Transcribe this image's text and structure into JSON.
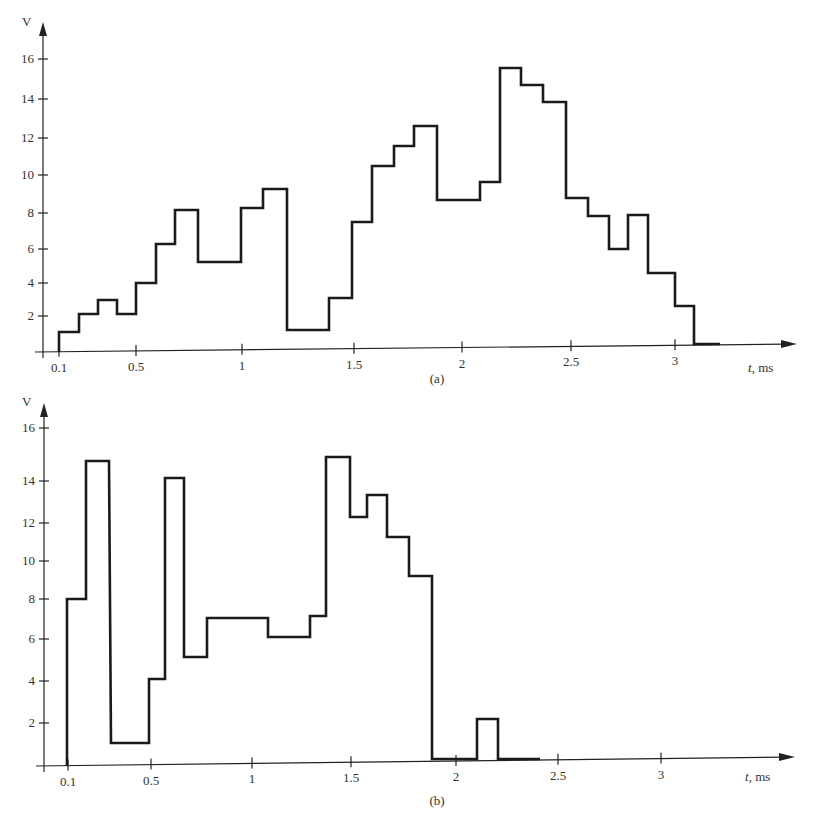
{
  "chart_data": [
    {
      "id": "a",
      "type": "line",
      "subtype": "step",
      "caption": "(a)",
      "ylabel": "V",
      "xlabel_italic": "t",
      "xlabel_rest": ", ms",
      "yticks": [
        2,
        4,
        6,
        8,
        10,
        12,
        14,
        16
      ],
      "xticks": [
        "0.1",
        "0.5",
        "1",
        "1.5",
        "2",
        "2.5",
        "3"
      ],
      "ylim": [
        0,
        17
      ],
      "xlim": [
        0,
        3.5
      ],
      "grid": false,
      "steps": {
        "t_edges": [
          0.1,
          0.2,
          0.3,
          0.4,
          0.5,
          0.6,
          0.7,
          0.8,
          1.0,
          1.1,
          1.2,
          1.4,
          1.5,
          1.6,
          1.7,
          1.8,
          1.9,
          2.1,
          2.2,
          2.3,
          2.4,
          2.5,
          2.6,
          2.7,
          2.8,
          2.9,
          3.0,
          3.1,
          3.2
        ],
        "values": [
          1.1,
          2.1,
          3.0,
          2.1,
          4.0,
          6.2,
          8.1,
          5.2,
          8.2,
          9.2,
          1.2,
          3.1,
          7.4,
          10.4,
          11.5,
          12.5,
          8.6,
          9.6,
          15.5,
          14.6,
          13.8,
          8.7,
          7.7,
          5.8,
          7.8,
          4.6,
          2.6,
          0.2
        ]
      }
    },
    {
      "id": "b",
      "type": "line",
      "subtype": "step",
      "caption": "(b)",
      "ylabel": "V",
      "xlabel_italic": "t",
      "xlabel_rest": ", ms",
      "yticks": [
        2,
        4,
        6,
        8,
        10,
        12,
        14,
        16
      ],
      "xticks": [
        "0.1",
        "0.5",
        "1",
        "1.5",
        "2",
        "2.5",
        "3"
      ],
      "ylim": [
        0,
        17
      ],
      "xlim": [
        0,
        3.5
      ],
      "grid": false,
      "steps": {
        "t_edges": [
          0.1,
          0.2,
          0.3,
          0.5,
          0.55,
          0.65,
          0.75,
          1.05,
          1.25,
          1.35,
          1.47,
          1.55,
          1.65,
          1.75,
          1.87,
          2.1,
          2.2,
          2.42
        ],
        "values": [
          8.0,
          14.9,
          1.0,
          4.1,
          14.1,
          5.1,
          7.1,
          6.2,
          7.2,
          15.0,
          12.2,
          13.3,
          11.2,
          9.2,
          0.2,
          2.2,
          0.2
        ]
      }
    }
  ],
  "geometry": {
    "a": {
      "axis_x": 43,
      "axis_top": 22,
      "base_left": 352,
      "base_right": 344,
      "arrow_tip_x": 797,
      "ytick_px": [
        316,
        283,
        249,
        213,
        175,
        138,
        99,
        59
      ],
      "xtick_px": [
        59,
        136,
        242,
        354,
        462,
        571,
        675
      ],
      "path_px": [
        [
          59,
          352
        ],
        [
          59,
          332
        ],
        [
          79,
          332
        ],
        [
          79,
          314
        ],
        [
          98,
          314
        ],
        [
          98,
          300
        ],
        [
          117,
          300
        ],
        [
          117,
          314
        ],
        [
          136,
          314
        ],
        [
          136,
          283
        ],
        [
          156,
          283
        ],
        [
          156,
          244
        ],
        [
          175,
          244
        ],
        [
          175,
          210
        ],
        [
          198,
          210
        ],
        [
          198,
          262
        ],
        [
          241,
          262
        ],
        [
          241,
          208
        ],
        [
          263,
          208
        ],
        [
          263,
          189
        ],
        [
          287,
          189
        ],
        [
          287,
          330
        ],
        [
          329,
          330
        ],
        [
          329,
          298
        ],
        [
          352,
          298
        ],
        [
          352,
          222
        ],
        [
          372,
          222
        ],
        [
          372,
          166
        ],
        [
          394,
          166
        ],
        [
          394,
          146
        ],
        [
          414,
          146
        ],
        [
          414,
          126
        ],
        [
          437,
          126
        ],
        [
          437,
          200
        ],
        [
          480,
          200
        ],
        [
          480,
          182
        ],
        [
          500,
          182
        ],
        [
          500,
          68
        ],
        [
          521,
          68
        ],
        [
          521,
          85
        ],
        [
          543,
          85
        ],
        [
          543,
          102
        ],
        [
          566,
          102
        ],
        [
          566,
          198
        ],
        [
          588,
          198
        ],
        [
          588,
          216
        ],
        [
          609,
          216
        ],
        [
          609,
          249
        ],
        [
          628,
          249
        ],
        [
          628,
          215
        ],
        [
          648,
          215
        ],
        [
          648,
          273
        ],
        [
          675,
          273
        ],
        [
          675,
          306
        ],
        [
          694,
          306
        ],
        [
          694,
          344
        ],
        [
          720,
          344
        ]
      ],
      "caption_xy": [
        437,
        383
      ],
      "xlabel_xy": [
        748,
        372
      ],
      "ylabel_xy": [
        22,
        26
      ]
    },
    "b": {
      "axis_x": 44,
      "axis_top": 403,
      "base_left": 766,
      "base_right": 757,
      "arrow_tip_x": 795,
      "ytick_px": [
        723,
        681,
        639,
        599,
        561,
        523,
        481,
        428
      ],
      "xtick_px": [
        68,
        151,
        252,
        351,
        456,
        558,
        661
      ],
      "path_px": [
        [
          67,
          766
        ],
        [
          67,
          599
        ],
        [
          86,
          599
        ],
        [
          86,
          461
        ],
        [
          109,
          461
        ],
        [
          111,
          743
        ],
        [
          149,
          743
        ],
        [
          149,
          679
        ],
        [
          165,
          679
        ],
        [
          165,
          478
        ],
        [
          184,
          478
        ],
        [
          184,
          657
        ],
        [
          207,
          657
        ],
        [
          207,
          618
        ],
        [
          268,
          618
        ],
        [
          268,
          637
        ],
        [
          310,
          637
        ],
        [
          310,
          616
        ],
        [
          326,
          616
        ],
        [
          326,
          457
        ],
        [
          350,
          457
        ],
        [
          350,
          517
        ],
        [
          367,
          517
        ],
        [
          367,
          495
        ],
        [
          387,
          495
        ],
        [
          387,
          537
        ],
        [
          409,
          537
        ],
        [
          409,
          576
        ],
        [
          432,
          576
        ],
        [
          432,
          759
        ],
        [
          477,
          759
        ],
        [
          477,
          719
        ],
        [
          498,
          719
        ],
        [
          498,
          759
        ],
        [
          540,
          759
        ]
      ],
      "caption_xy": [
        437,
        805
      ],
      "xlabel_xy": [
        745,
        781
      ],
      "ylabel_xy": [
        22,
        406
      ]
    }
  }
}
